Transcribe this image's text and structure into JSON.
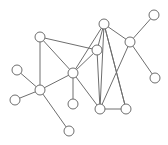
{
  "figure": {
    "background_color": "#ffffff",
    "width": 168,
    "height": 145
  },
  "chart_data": {
    "type": "diagram",
    "subtype": "node-link-graph",
    "xlabel": "",
    "ylabel": "",
    "grid": false,
    "legend": "none",
    "node_style": {
      "shape": "circle",
      "radius": 5,
      "fill_color": "#ffffff",
      "stroke_color": "#6e6e6e",
      "stroke_width": 1
    },
    "edge_style": {
      "stroke_color": "#6e6e6e",
      "stroke_width": 1,
      "directed": false
    },
    "node_count": 16,
    "edge_count": 21,
    "nodes": [
      {
        "id": "n0",
        "label": "",
        "x": 40,
        "y": 37,
        "degree": 3
      },
      {
        "id": "n1",
        "label": "",
        "x": 104,
        "y": 24,
        "degree": 5
      },
      {
        "id": "n2",
        "label": "",
        "x": 154,
        "y": 15,
        "degree": 1
      },
      {
        "id": "n3",
        "label": "",
        "x": 130,
        "y": 42,
        "degree": 4
      },
      {
        "id": "n4",
        "label": "",
        "x": 97,
        "y": 50,
        "degree": 4
      },
      {
        "id": "n5",
        "label": "",
        "x": 17,
        "y": 70,
        "degree": 1
      },
      {
        "id": "n6",
        "label": "",
        "x": 73,
        "y": 73,
        "degree": 6
      },
      {
        "id": "n7",
        "label": "",
        "x": 155,
        "y": 78,
        "degree": 1
      },
      {
        "id": "n8",
        "label": "",
        "x": 40,
        "y": 90,
        "degree": 5
      },
      {
        "id": "n9",
        "label": "",
        "x": 15,
        "y": 100,
        "degree": 1
      },
      {
        "id": "n10",
        "label": "",
        "x": 73,
        "y": 104,
        "degree": 1
      },
      {
        "id": "n11",
        "label": "",
        "x": 100,
        "y": 109,
        "degree": 3
      },
      {
        "id": "n12",
        "label": "",
        "x": 126,
        "y": 109,
        "degree": 3
      },
      {
        "id": "n13",
        "label": "",
        "x": 69,
        "y": 131,
        "degree": 1
      }
    ],
    "edges": [
      {
        "source": "n0",
        "target": "n4"
      },
      {
        "source": "n0",
        "target": "n6"
      },
      {
        "source": "n0",
        "target": "n8"
      },
      {
        "source": "n1",
        "target": "n3"
      },
      {
        "source": "n1",
        "target": "n4"
      },
      {
        "source": "n1",
        "target": "n6"
      },
      {
        "source": "n1",
        "target": "n11"
      },
      {
        "source": "n1",
        "target": "n12"
      },
      {
        "source": "n2",
        "target": "n3"
      },
      {
        "source": "n3",
        "target": "n7"
      },
      {
        "source": "n3",
        "target": "n11"
      },
      {
        "source": "n4",
        "target": "n6"
      },
      {
        "source": "n4",
        "target": "n11"
      },
      {
        "source": "n5",
        "target": "n8"
      },
      {
        "source": "n6",
        "target": "n8"
      },
      {
        "source": "n6",
        "target": "n10"
      },
      {
        "source": "n6",
        "target": "n11"
      },
      {
        "source": "n8",
        "target": "n9"
      },
      {
        "source": "n8",
        "target": "n13"
      },
      {
        "source": "n11",
        "target": "n12"
      },
      {
        "source": "n12",
        "target": "n1"
      }
    ]
  }
}
